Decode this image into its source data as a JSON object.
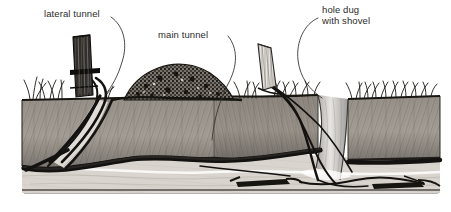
{
  "figure": {
    "style": "pen-and-ink hatched line drawing",
    "width": 451,
    "height": 212,
    "background_color": "#ffffff",
    "ink_color": "#1a1a1a",
    "soil_fill_color": "#9a938c",
    "soil_dark_color": "#4a453f",
    "subsoil_color": "#cfc9c2",
    "label_color": "#2b2b2b"
  },
  "labels": [
    {
      "id": "lateral-tunnel",
      "text": "lateral tunnel",
      "lines": [
        "lateral tunnel"
      ],
      "x": 44,
      "y": 8
    },
    {
      "id": "main-tunnel",
      "text": "main tunnel",
      "lines": [
        "main tunnel"
      ],
      "x": 158,
      "y": 29
    },
    {
      "id": "hole-dug-with-shovel",
      "text": "hole dug with shovel",
      "lines": [
        "hole dug",
        "with shovel"
      ],
      "x": 322,
      "y": 4
    }
  ],
  "leader_lines": [
    {
      "id": "leader-lateral-tunnel",
      "from_label": "lateral tunnel",
      "points_to": "lateral tunnel opening beside left stake"
    },
    {
      "id": "leader-main-tunnel",
      "from_label": "main tunnel",
      "points_to": "horizontal main tunnel in soil cross-section"
    },
    {
      "id": "leader-hole-dug",
      "from_label": "hole dug with shovel",
      "points_to": "excavated vertical hole at right of section"
    }
  ],
  "scene_elements": [
    {
      "id": "left-stake",
      "name": "dark wooden stake",
      "description": "vertical dark hatched post at left, driven into ground"
    },
    {
      "id": "right-stake",
      "name": "light wooden stake",
      "description": "tilted pale hatched post at center-right"
    },
    {
      "id": "soil-mound",
      "name": "mound of excavated soil",
      "description": "dark stippled mound of loose dirt on surface at center"
    },
    {
      "id": "grass-tufts",
      "name": "grass tufts",
      "description": "clumps of grass blades along the ground surface"
    },
    {
      "id": "soil-block",
      "name": "soil cross-section block",
      "description": "cutaway earth showing subsurface layers"
    },
    {
      "id": "main-tunnel-path",
      "name": "main tunnel",
      "description": "long horizontal dark burrow running through the soil"
    },
    {
      "id": "lateral-tunnel-path",
      "name": "lateral tunnel",
      "description": "sloping burrow from surface down to the main tunnel at left"
    },
    {
      "id": "shovel-hole",
      "name": "hole dug with shovel",
      "description": "vertical excavated pit cutting the soil at right"
    },
    {
      "id": "subsoil-layer",
      "name": "subsoil layer",
      "description": "pale banded layer below the tunnel level"
    },
    {
      "id": "trap-devices",
      "name": "traps in tunnel",
      "description": "dark elongated devices placed inside the tunnel at lower right"
    }
  ]
}
